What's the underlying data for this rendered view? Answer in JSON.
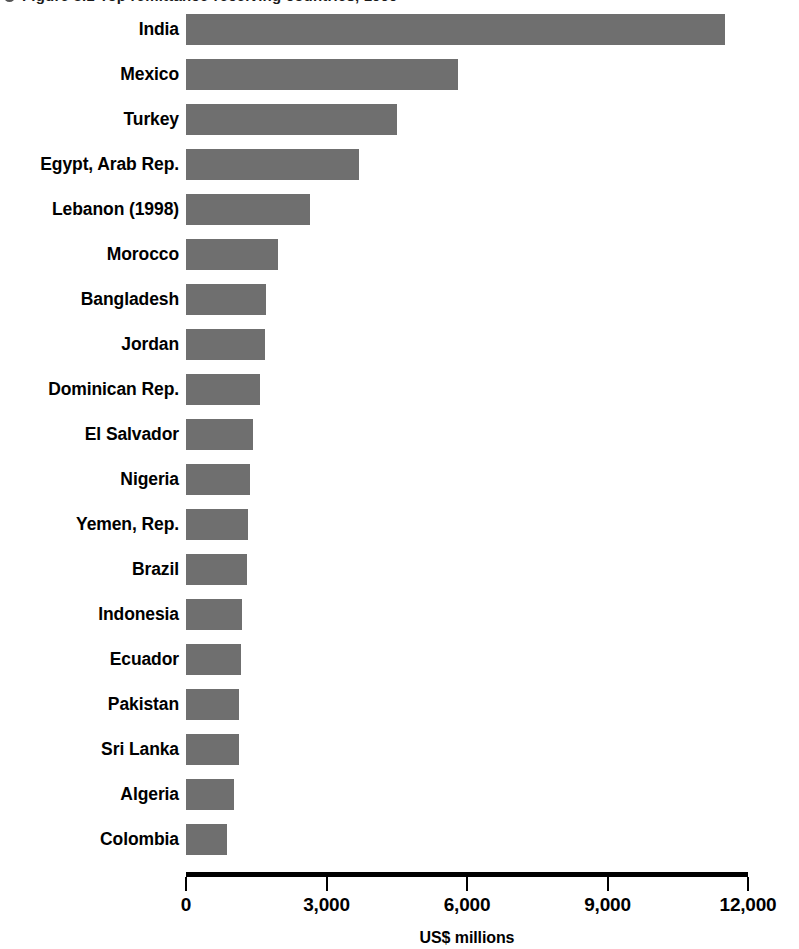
{
  "figure": {
    "title_clipped": "Figure 3.1   Top remittance-receiving countries, 1999",
    "title_bullet_icon": "bullet-dot-icon"
  },
  "chart_data": {
    "type": "bar",
    "orientation": "horizontal",
    "title": "",
    "xlabel": "US$ millions",
    "ylabel": "",
    "xlim": [
      0,
      12000
    ],
    "xticks": [
      0,
      3000,
      6000,
      9000,
      12000
    ],
    "xtick_labels": [
      "0",
      "3,000",
      "6,000",
      "9,000",
      "12,000"
    ],
    "grid": false,
    "legend": null,
    "bar_color": "#6f6f6f",
    "axis_color": "#000000",
    "categories": [
      "India",
      "Mexico",
      "Turkey",
      "Egypt, Arab Rep.",
      "Lebanon (1998)",
      "Morocco",
      "Bangladesh",
      "Jordan",
      "Dominican Rep.",
      "El Salvador",
      "Nigeria",
      "Yemen, Rep.",
      "Brazil",
      "Indonesia",
      "Ecuador",
      "Pakistan",
      "Sri Lanka",
      "Algeria",
      "Colombia"
    ],
    "values": [
      11500,
      5800,
      4500,
      3700,
      2650,
      1970,
      1700,
      1690,
      1580,
      1430,
      1370,
      1320,
      1300,
      1200,
      1180,
      1140,
      1130,
      1030,
      870
    ],
    "units": "US$ millions"
  },
  "axis": {
    "title": "US$ millions",
    "ticks": [
      {
        "label": "0",
        "value": 0
      },
      {
        "label": "3,000",
        "value": 3000
      },
      {
        "label": "6,000",
        "value": 6000
      },
      {
        "label": "9,000",
        "value": 9000
      },
      {
        "label": "12,000",
        "value": 12000
      }
    ]
  }
}
